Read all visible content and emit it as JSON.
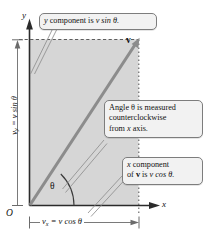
{
  "figure": {
    "type": "vector-component-diagram"
  },
  "axes": {
    "y_label": "y",
    "x_label": "x",
    "origin_label": "O"
  },
  "vector": {
    "label": "v",
    "angle_label": "θ"
  },
  "dimensions": {
    "vertical": {
      "name": "y-component-dimension",
      "text_parts": {
        "symbol": "v",
        "subscript": "y",
        "equals": " = ",
        "expression": "v sin θ"
      },
      "text": "v_y = v sin θ"
    },
    "horizontal": {
      "name": "x-component-dimension",
      "text_parts": {
        "symbol": "v",
        "subscript": "x",
        "equals": " = ",
        "expression": "v cos θ"
      },
      "text": "v_x = v cos θ"
    }
  },
  "callouts": {
    "y_component": {
      "line1_pre": "y",
      "line1_post": " component is ",
      "line1_expr": "v sin θ.",
      "full_text": "y component is v sin θ."
    },
    "angle": {
      "line1": "Angle θ is measured",
      "line2": "counterclockwise",
      "line3_pre": "from ",
      "line3_var": "x",
      "line3_post": " axis.",
      "full_text": "Angle θ is measured counterclockwise from x axis."
    },
    "x_component": {
      "line1_var": "x",
      "line1_post": " component",
      "line2_pre": "of ",
      "line2_vec": "v",
      "line2_mid": " is ",
      "line2_expr": "v cos θ.",
      "full_text": "x component of v is v cos θ."
    }
  },
  "colors": {
    "shaded_region": "#d6d6d6",
    "vector_line": "#8c8c8c",
    "axis": "#2b2b2b",
    "callout_fill": "#f2f2f2",
    "callout_border": "#7d7d7d",
    "leader_line": "#909090"
  }
}
